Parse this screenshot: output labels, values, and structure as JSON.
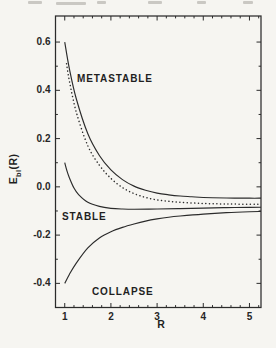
{
  "figure": {
    "xlabel": "R",
    "ylabel": {
      "main": "E",
      "sub": "bl",
      "paren": "(R)"
    },
    "x_tick_labels": [
      "1",
      "2",
      "3",
      "4",
      "5"
    ],
    "y_tick_labels": [
      "0.6",
      "0.4",
      "0.2",
      "0.0",
      "-0.2",
      "-0.4"
    ],
    "region_labels": {
      "metastable": "METASTABLE",
      "stable": "STABLE",
      "collapse": "COLLAPSE"
    },
    "ink_color": "#2b2b2b",
    "paper_color": "#f6f5f1"
  },
  "chart_data": {
    "type": "line",
    "title": "",
    "xlabel": "R",
    "ylabel": "E_bl(R)",
    "xlim": [
      0.8,
      5.25
    ],
    "ylim": [
      -0.5,
      0.708
    ],
    "grid": false,
    "legend": "none",
    "x_major_ticks": [
      1,
      2,
      3,
      4,
      5
    ],
    "x_minor_step": 0.2,
    "y_major_ticks": [
      0.6,
      0.4,
      0.2,
      0.0,
      -0.2,
      -0.4
    ],
    "y_minor_ticks": [
      0.5,
      0.3,
      0.1,
      -0.1,
      -0.3
    ],
    "annotations": [
      "METASTABLE",
      "STABLE",
      "COLLAPSE"
    ],
    "series": [
      {
        "name": "metastable-upper",
        "style": "solid",
        "x": [
          1,
          1.1,
          1.25,
          1.5,
          1.75,
          2,
          2.25,
          2.5,
          2.75,
          3,
          3.25,
          3.5,
          3.75,
          4,
          4.5,
          5,
          5.25
        ],
        "y": [
          0.6,
          0.49,
          0.365,
          0.22,
          0.13,
          0.07,
          0.03,
          0.003,
          -0.014,
          -0.026,
          -0.033,
          -0.038,
          -0.041,
          -0.044,
          -0.046,
          -0.047,
          -0.047
        ]
      },
      {
        "name": "metastable-dotted",
        "style": "dotted",
        "x": [
          1.04,
          1.1,
          1.25,
          1.5,
          1.75,
          2,
          2.25,
          2.5,
          2.75,
          3,
          3.25,
          3.5,
          4,
          4.5,
          5,
          5.25
        ],
        "y": [
          0.51,
          0.44,
          0.31,
          0.17,
          0.09,
          0.035,
          -0.003,
          -0.028,
          -0.044,
          -0.054,
          -0.06,
          -0.064,
          -0.069,
          -0.071,
          -0.072,
          -0.072
        ]
      },
      {
        "name": "stable",
        "style": "solid",
        "x": [
          1,
          1.05,
          1.1,
          1.2,
          1.3,
          1.5,
          1.75,
          2,
          2.25,
          2.5,
          3,
          3.5,
          4,
          4.5,
          5,
          5.25
        ],
        "y": [
          0.1,
          0.065,
          0.038,
          -0.005,
          -0.032,
          -0.064,
          -0.081,
          -0.089,
          -0.092,
          -0.093,
          -0.092,
          -0.09,
          -0.088,
          -0.086,
          -0.085,
          -0.0845
        ]
      },
      {
        "name": "collapse",
        "style": "solid",
        "x": [
          1,
          1.1,
          1.25,
          1.5,
          1.75,
          2,
          2.25,
          2.5,
          2.75,
          3,
          3.25,
          3.5,
          4,
          4.5,
          5,
          5.25
        ],
        "y": [
          -0.4,
          -0.363,
          -0.316,
          -0.253,
          -0.212,
          -0.186,
          -0.168,
          -0.154,
          -0.142,
          -0.133,
          -0.126,
          -0.121,
          -0.113,
          -0.107,
          -0.103,
          -0.102
        ]
      }
    ]
  }
}
